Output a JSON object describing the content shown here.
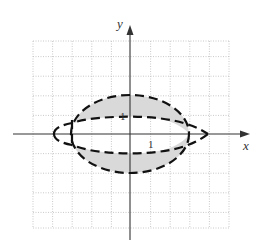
{
  "diagram": {
    "type": "coordinate-plane-region",
    "axes": {
      "x_label": "x",
      "y_label": "y",
      "x_tick_label": "1",
      "y_tick_label": "1"
    },
    "grid": {
      "x_range": [
        -5,
        5
      ],
      "y_range": [
        -4.8,
        4.8
      ],
      "cell_units": 1,
      "style": "dotted"
    },
    "curves": [
      {
        "name": "outer-ellipse",
        "style": "dashed",
        "description": "ellipse with x-radius 3, y-radius 2"
      },
      {
        "name": "upper-curve",
        "style": "dashed",
        "description": "curve near y = 1 joining left cusp and right point"
      },
      {
        "name": "lower-curve",
        "style": "dashed",
        "description": "curve near y = -1 joining left cusp and right point"
      }
    ],
    "shaded_regions": [
      {
        "name": "upper-shaded",
        "description": "region between outer ellipse and upper curve"
      },
      {
        "name": "lower-shaded",
        "description": "region between outer ellipse and lower curve"
      }
    ],
    "colors": {
      "shade": "#d9d9d9",
      "curve": "#111111",
      "axis": "#333333",
      "grid": "#bbbbbb"
    }
  }
}
